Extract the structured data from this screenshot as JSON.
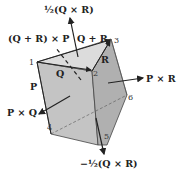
{
  "diagram": {
    "vertex_labels": [
      "1",
      "2",
      "3",
      "4",
      "5",
      "6"
    ],
    "vectors": {
      "half_qxr": "½(Q × R)",
      "q_plus_r_x_p": "(Q + R) × P",
      "q_plus_r": "Q + R",
      "q": "Q",
      "r": "R",
      "p": "P",
      "p_x_r": "P × R",
      "p_x_q": "P × Q",
      "neg_half_qxr": "−½(Q × R)"
    },
    "colors": {
      "top_face": "#dcdcdc",
      "front_face": "#c4c4c4",
      "right_face": "#b0b0b0",
      "edge": "#444444",
      "arrow": "#222222"
    }
  }
}
